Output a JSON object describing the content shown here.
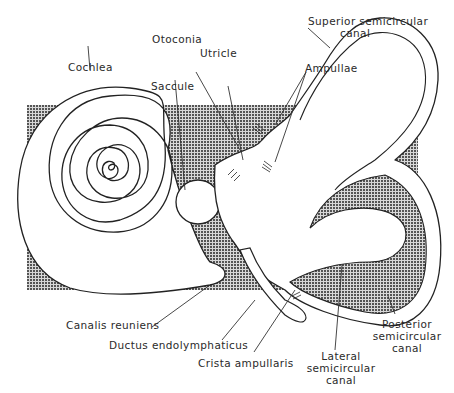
{
  "diagram": {
    "background_color": "#ffffff",
    "shading_color": "#9a9a9a",
    "line_color": "#222222",
    "labels": {
      "superior_semicircular_canal": {
        "line1": "Superior semicircular",
        "line2": "canal"
      },
      "otoconia": "Otoconia",
      "utricle": "Utricle",
      "cochlea": "Cochlea",
      "saccule": "Saccule",
      "ampullae": "Ampullae",
      "canalis_reuniens": "Canalis reuniens",
      "ductus_endolymphaticus": "Ductus endolymphaticus",
      "crista_ampullaris": "Crista ampullaris",
      "lateral_semicircular_canal": {
        "line1": "Lateral",
        "line2": "semicircular",
        "line3": "canal"
      },
      "posterior_semicircular_canal": {
        "line1": "Posterior",
        "line2": "semicircular",
        "line3": "canal"
      }
    }
  }
}
